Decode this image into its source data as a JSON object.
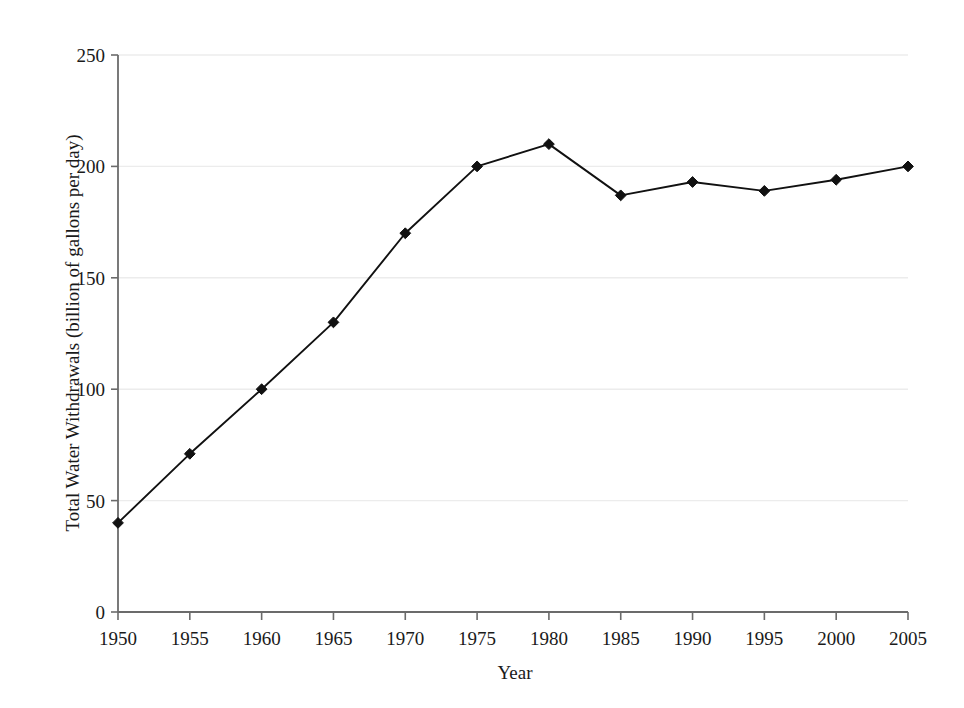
{
  "chart_data": {
    "type": "line",
    "title": "",
    "xlabel": "Year",
    "ylabel": "Total Water Withdrawals (billion of gallons per day)",
    "x": [
      1950,
      1955,
      1960,
      1965,
      1970,
      1975,
      1980,
      1985,
      1990,
      1995,
      2000,
      2005
    ],
    "values": [
      40,
      71,
      100,
      130,
      170,
      200,
      210,
      187,
      193,
      189,
      194,
      200
    ],
    "series": [
      {
        "name": "Total Water Withdrawals",
        "values": [
          40,
          71,
          100,
          130,
          170,
          200,
          210,
          187,
          193,
          189,
          194,
          200
        ]
      }
    ],
    "xlim": [
      1950,
      2005
    ],
    "ylim": [
      0,
      250
    ],
    "x_ticks": [
      1950,
      1955,
      1960,
      1965,
      1970,
      1975,
      1980,
      1985,
      1990,
      1995,
      2000,
      2005
    ],
    "x_tick_labels": [
      "1950",
      "1955",
      "1960",
      "1965",
      "1970",
      "1975",
      "1980",
      "1985",
      "1990",
      "1995",
      "2000",
      "2005"
    ],
    "y_ticks": [
      0,
      50,
      100,
      150,
      200,
      250
    ],
    "y_tick_labels": [
      "0",
      "50",
      "100",
      "150",
      "200",
      "250"
    ],
    "grid": true,
    "grid_axis": "y",
    "legend": false,
    "legend_position": "none",
    "marker": "diamond",
    "marker_color": "#111111",
    "line_color": "#111111",
    "grid_color": "#ececec",
    "axis_color": "#6b6b6b",
    "background_color": "#ffffff"
  }
}
